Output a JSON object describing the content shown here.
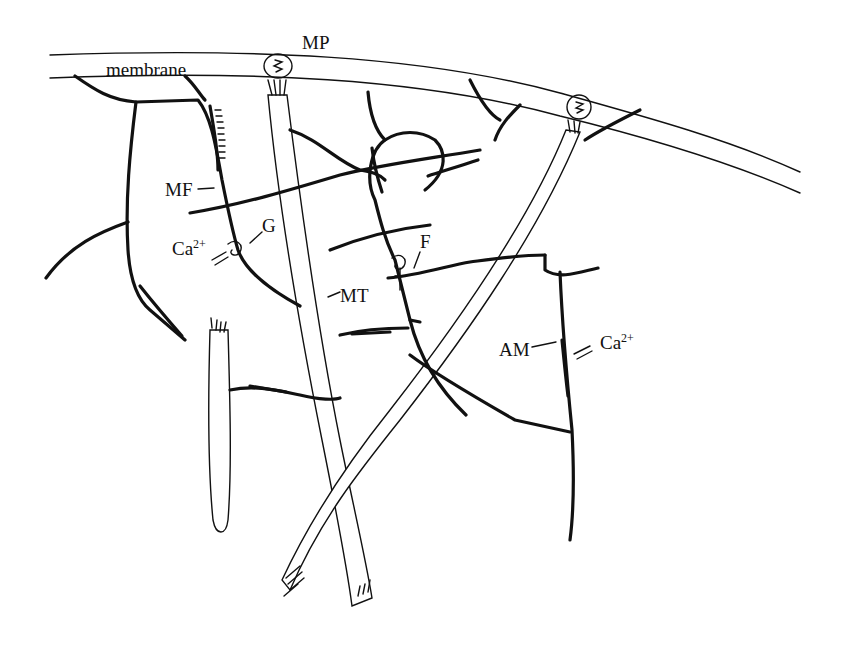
{
  "diagram": {
    "type": "cytoskeleton schematic",
    "labels": {
      "membrane": "membrane",
      "membrane_protein": "MP",
      "microfilament": "MF",
      "gelsolin_like": "G",
      "fragmin_like": "F",
      "microtubule": "MT",
      "actin_myosin": "AM",
      "calcium_left": "Ca",
      "calcium_left_charge": "2+",
      "calcium_right": "Ca",
      "calcium_right_charge": "2+"
    },
    "colors": {
      "ink": "#111111",
      "background": "#ffffff"
    }
  }
}
